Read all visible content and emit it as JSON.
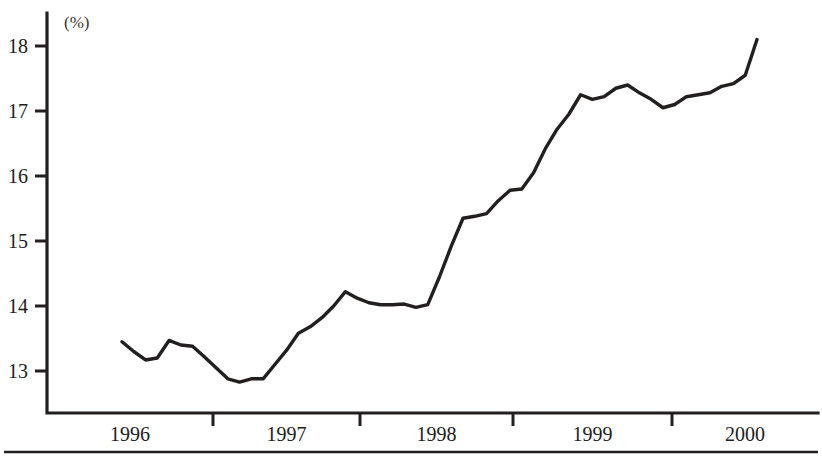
{
  "chart_data": {
    "type": "line",
    "title": "",
    "subtitle": "",
    "xlabel": "",
    "ylabel": "",
    "unit_label": "(%)",
    "grid": false,
    "legend": null,
    "ylim": [
      12.4,
      18.4
    ],
    "yticks": [
      13,
      14,
      15,
      16,
      17,
      18
    ],
    "ytick_labels": [
      "13",
      "14",
      "15",
      "16",
      "17",
      "18"
    ],
    "xtick_labels": [
      "1996",
      "1997",
      "1998",
      "1999",
      "2000"
    ],
    "x_axis_note": "year labels centered between boundary tick marks",
    "x": [
      "1995-08",
      "1995-09",
      "1995-10",
      "1995-11",
      "1995-12",
      "1996-01",
      "1996-02",
      "1996-03",
      "1996-04",
      "1996-05",
      "1996-06",
      "1996-07",
      "1996-08",
      "1996-09",
      "1996-10",
      "1996-11",
      "1996-12",
      "1997-01",
      "1997-02",
      "1997-03",
      "1997-04",
      "1997-05",
      "1997-06",
      "1997-07",
      "1997-08",
      "1997-09",
      "1997-10",
      "1997-11",
      "1997-12",
      "1998-01",
      "1998-02",
      "1998-03",
      "1998-04",
      "1998-05",
      "1998-06",
      "1998-07",
      "1998-08",
      "1998-09",
      "1998-10",
      "1998-11",
      "1998-12",
      "1999-01",
      "1999-02",
      "1999-03",
      "1999-04",
      "1999-05",
      "1999-06",
      "1999-07",
      "1999-08",
      "1999-09",
      "1999-10",
      "1999-11",
      "1999-12",
      "2000-01",
      "2000-02"
    ],
    "values": [
      13.45,
      13.3,
      13.17,
      13.2,
      13.47,
      13.4,
      13.38,
      13.22,
      13.05,
      12.88,
      12.83,
      12.88,
      12.88,
      13.1,
      13.32,
      13.58,
      13.68,
      13.82,
      14.0,
      14.22,
      14.12,
      14.05,
      14.02,
      14.02,
      14.03,
      13.98,
      14.02,
      14.45,
      14.92,
      15.35,
      15.38,
      15.42,
      15.62,
      15.78,
      15.8,
      16.05,
      16.42,
      16.72,
      16.95,
      17.25,
      17.18,
      17.22,
      17.35,
      17.4,
      17.28,
      17.18,
      17.05,
      17.1,
      17.22,
      17.25,
      17.28,
      17.38,
      17.42,
      17.55,
      18.1
    ],
    "series": [
      {
        "name": "series-1",
        "color": "#231f1f",
        "values": [
          13.45,
          13.3,
          13.17,
          13.2,
          13.47,
          13.4,
          13.38,
          13.22,
          13.05,
          12.88,
          12.83,
          12.88,
          12.88,
          13.1,
          13.32,
          13.58,
          13.68,
          13.82,
          14.0,
          14.22,
          14.12,
          14.05,
          14.02,
          14.02,
          14.03,
          13.98,
          14.02,
          14.45,
          14.92,
          15.35,
          15.38,
          15.42,
          15.62,
          15.78,
          15.8,
          16.05,
          16.42,
          16.72,
          16.95,
          17.25,
          17.18,
          17.22,
          17.35,
          17.4,
          17.28,
          17.18,
          17.05,
          17.1,
          17.22,
          17.25,
          17.28,
          17.38,
          17.42,
          17.55,
          18.1
        ]
      }
    ],
    "colors": {
      "line": "#231f1f",
      "axis": "#231f1f",
      "text": "#201c1c",
      "background": "#ffffff"
    }
  },
  "geometry": {
    "plot_left": 47,
    "plot_right": 818,
    "plot_top": 13,
    "axis_y": 413,
    "y_for_18": 46,
    "y_for_13": 371,
    "px_per_unit": 65,
    "x_first_point": 122,
    "x_last_point": 757,
    "x_boundary_ticks": [
      213,
      360,
      513,
      672
    ],
    "rule_y": 452
  }
}
